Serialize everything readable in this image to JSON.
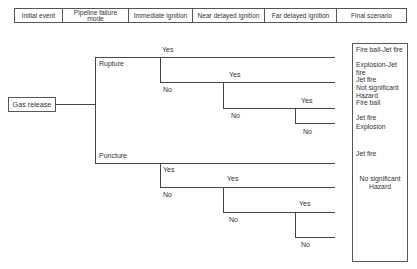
{
  "header": {
    "columns": [
      "Initial event",
      "Pipeline failure mode",
      "Immediate ignition",
      "Near delayed ignition",
      "Far delayed ignition",
      "Final scenario"
    ]
  },
  "tree": {
    "root": "Gas release",
    "failure_modes": [
      "Rupture",
      "Puncture"
    ],
    "branch_labels": {
      "yes": "Yes",
      "no": "No"
    }
  },
  "final_scenarios": {
    "rupture": [
      "Fire ball-Jet fire",
      "Explosion-Jet fire",
      "Jet fire",
      "Not significant Hazard",
      "Fire ball",
      "Jet fire",
      "Explosion"
    ],
    "puncture": [
      "Jet fire",
      "No significant Hazard"
    ]
  }
}
